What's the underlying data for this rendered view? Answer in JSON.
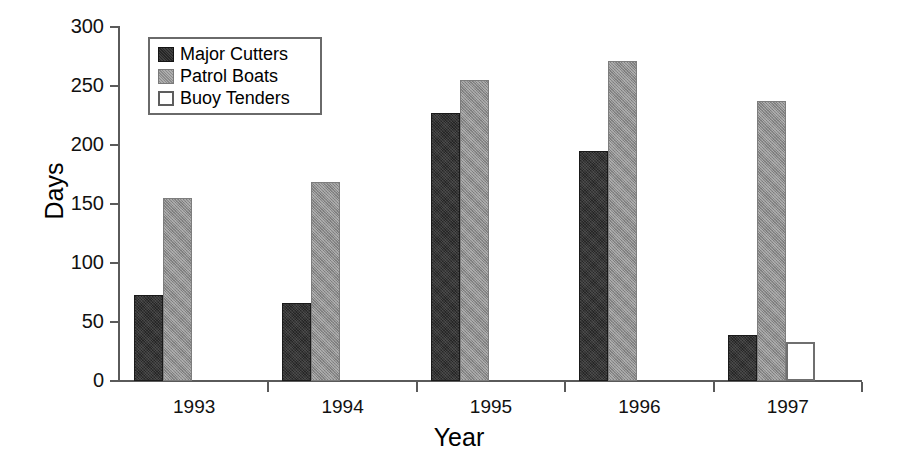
{
  "chart_data": {
    "type": "bar",
    "title": "",
    "xlabel": "Year",
    "ylabel": "Days",
    "categories": [
      "1993",
      "1994",
      "1995",
      "1996",
      "1997"
    ],
    "series": [
      {
        "name": "Major Cutters",
        "color": "#262626",
        "values": [
          73,
          66,
          227,
          195,
          39
        ]
      },
      {
        "name": "Patrol Boats",
        "color": "#8b8b8b",
        "values": [
          155,
          169,
          255,
          271,
          237
        ]
      },
      {
        "name": "Buoy Tenders",
        "color": "#ffffff",
        "values": [
          null,
          null,
          null,
          null,
          33
        ]
      }
    ],
    "ylim": [
      0,
      300
    ],
    "yticks": [
      0,
      50,
      100,
      150,
      200,
      250,
      300
    ],
    "ytick_labels": [
      "0",
      "50",
      "100",
      "150",
      "200",
      "250",
      "300"
    ],
    "grid": false,
    "legend_position": "top-left"
  },
  "legend": {
    "entries": [
      {
        "label": "Major Cutters",
        "swatch": "major"
      },
      {
        "label": "Patrol Boats",
        "swatch": "patrol"
      },
      {
        "label": "Buoy Tenders",
        "swatch": "buoy"
      }
    ]
  }
}
